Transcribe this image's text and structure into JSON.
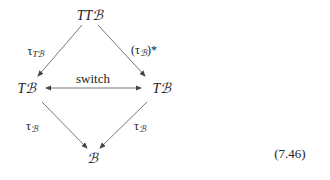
{
  "diagram": {
    "nodes": {
      "top": "TTℬ",
      "left": "Tℬ",
      "right": "Tℬ",
      "bottom": "ℬ"
    },
    "edges": {
      "top_left": {
        "base": "τ",
        "sub": "Tℬ"
      },
      "top_right": {
        "base": "(τ",
        "sub": "ℬ",
        "tail": ")*"
      },
      "left_right": "switch",
      "left_bottom": {
        "base": "τ",
        "sub": "ℬ"
      },
      "right_bottom": {
        "base": "τ",
        "sub": "ℬ"
      }
    },
    "equation_number": "(7.46)"
  }
}
